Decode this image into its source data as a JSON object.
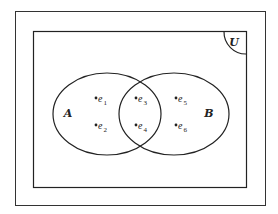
{
  "diagram": {
    "type": "venn",
    "universe": {
      "label": "U"
    },
    "sets": [
      {
        "id": "A",
        "label": "A",
        "elements": [
          "e1",
          "e2",
          "e3",
          "e4"
        ]
      },
      {
        "id": "B",
        "label": "B",
        "elements": [
          "e3",
          "e4",
          "e5",
          "e6"
        ]
      }
    ],
    "elements": [
      {
        "id": "e1",
        "base": "e",
        "sub": "1",
        "region": "A only"
      },
      {
        "id": "e2",
        "base": "e",
        "sub": "2",
        "region": "A only"
      },
      {
        "id": "e3",
        "base": "e",
        "sub": "3",
        "region": "A and B"
      },
      {
        "id": "e4",
        "base": "e",
        "sub": "4",
        "region": "A and B"
      },
      {
        "id": "e5",
        "base": "e",
        "sub": "5",
        "region": "B only"
      },
      {
        "id": "e6",
        "base": "e",
        "sub": "6",
        "region": "B only"
      }
    ],
    "colors": {
      "stroke": "#222222",
      "background": "#ffffff"
    }
  }
}
